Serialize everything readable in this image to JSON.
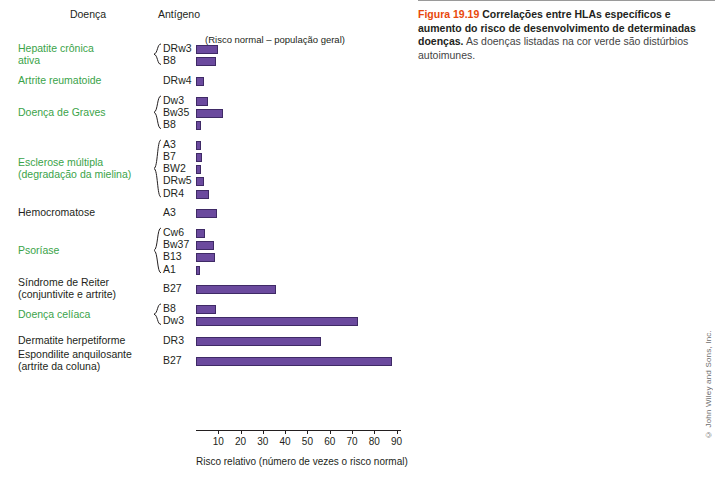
{
  "headers": {
    "disease": "Doença",
    "antigen": "Antígeno",
    "risk_note": "(Risco normal – população geral)"
  },
  "caption": {
    "fignum": "Figura 19.19",
    "bold": "Correlações entre HLAs específicos e aumento do risco de desenvolvimento de determinadas doenças.",
    "rest": "As doenças listadas na cor verde são distúrbios autoimunes."
  },
  "credit": "© John Wiley and Sons, Inc.",
  "chart_data": {
    "type": "bar",
    "title": "",
    "xlabel": "Risco relativo (número de vezes o risco normal)",
    "ylabel": "",
    "xlim": [
      0,
      92
    ],
    "xticks": [
      10,
      20,
      30,
      40,
      50,
      60,
      70,
      80,
      90
    ],
    "grid": false,
    "legend": null,
    "orientation": "horizontal",
    "groups": [
      {
        "disease": "Hepatite crônica\nativa",
        "green": true,
        "brace": true,
        "antigens": [
          "DRw3",
          "B8"
        ],
        "values": [
          9.7,
          8.9
        ]
      },
      {
        "disease": "Artrite reumatoide",
        "green": true,
        "brace": false,
        "antigens": [
          "DRw4"
        ],
        "values": [
          3.8
        ]
      },
      {
        "disease": "Doença de Graves",
        "green": true,
        "brace": true,
        "antigens": [
          "Dw3",
          "Bw35",
          "B8"
        ],
        "values": [
          5.5,
          12.1,
          2.2
        ]
      },
      {
        "disease": "Esclerose múltipla\n(degradação da mielina)",
        "green": true,
        "brace": true,
        "antigens": [
          "A3",
          "B7",
          "BW2",
          "DRw5",
          "DR4"
        ],
        "values": [
          2.3,
          2.6,
          2.1,
          3.8,
          5.9
        ]
      },
      {
        "disease": "Hemocromatose",
        "green": false,
        "brace": false,
        "antigens": [
          "A3"
        ],
        "values": [
          9.3
        ]
      },
      {
        "disease": "Psoríase",
        "green": true,
        "brace": true,
        "antigens": [
          "Cw6",
          "Bw37",
          "B13",
          "A1"
        ],
        "values": [
          4.2,
          8.0,
          8.7,
          2.0
        ]
      },
      {
        "disease": "Síndrome de Reiter\n(conjuntivite e artrite)",
        "green": false,
        "brace": false,
        "antigens": [
          "B27"
        ],
        "values": [
          36.0
        ]
      },
      {
        "disease": "Doença celíaca",
        "green": true,
        "brace": true,
        "antigens": [
          "B8",
          "Dw3"
        ],
        "values": [
          8.8,
          72.5
        ]
      },
      {
        "disease": "Dermatite herpetiforme",
        "green": false,
        "brace": false,
        "antigens": [
          "DR3"
        ],
        "values": [
          56.0
        ]
      },
      {
        "disease": "Espondilite anquilosante\n(artrite da coluna)",
        "green": false,
        "brace": false,
        "antigens": [
          "B27"
        ],
        "values": [
          88.0
        ]
      }
    ]
  }
}
